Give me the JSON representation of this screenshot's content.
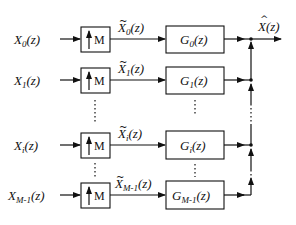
{
  "diagram": {
    "type": "synthesis filter bank",
    "upsampler_label": "M",
    "rows": [
      {
        "input": "X",
        "input_sub": "0",
        "mid": "X",
        "mid_sub": "0",
        "filter": "G",
        "filter_sub": "0",
        "arg": "(z)",
        "y": 39
      },
      {
        "input": "X",
        "input_sub": "1",
        "mid": "X",
        "mid_sub": "1",
        "filter": "G",
        "filter_sub": "1",
        "arg": "(z)",
        "y": 80
      },
      {
        "input": "X",
        "input_sub": "i",
        "mid": "X",
        "mid_sub": "i",
        "filter": "G",
        "filter_sub": "i",
        "arg": "(z)",
        "y": 145
      },
      {
        "input": "X",
        "input_sub": "M-1",
        "mid": "X",
        "mid_sub": "M-1",
        "filter": "G",
        "filter_sub": "M-1",
        "arg": "(z)",
        "y": 195
      }
    ],
    "output": {
      "symbol": "X",
      "hat": "^",
      "arg": "(z)"
    },
    "ellipsis": "⋮"
  }
}
